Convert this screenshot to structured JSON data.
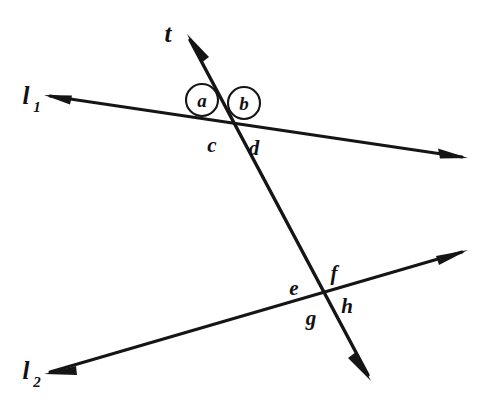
{
  "figure": {
    "background_color": "#ffffff",
    "ink_color": "#151515",
    "width": 485,
    "height": 413
  },
  "lines": [
    {
      "id": "l1",
      "label": "l",
      "subscript": "1",
      "label_x": 26,
      "label_y": 104,
      "sub_x": 41,
      "sub_y": 112,
      "x1": 50,
      "y1": 96,
      "x2": 462,
      "y2": 157,
      "arrow_start": true,
      "arrow_end": true,
      "stroke_width": 3.0
    },
    {
      "id": "l2",
      "label": "l",
      "subscript": "2",
      "label_x": 26,
      "label_y": 379,
      "sub_x": 41,
      "sub_y": 387,
      "x1": 50,
      "y1": 372,
      "x2": 462,
      "y2": 252,
      "arrow_start": true,
      "arrow_end": true,
      "stroke_width": 3.0
    },
    {
      "id": "t",
      "label": "t",
      "subscript": "",
      "label_x": 165,
      "label_y": 40,
      "sub_x": 0,
      "sub_y": 0,
      "x1": 190,
      "y1": 40,
      "x2": 368,
      "y2": 375,
      "arrow_start": true,
      "arrow_end": true,
      "stroke_width": 3.4
    }
  ],
  "intersections": [
    {
      "id": "upper",
      "x": 230,
      "y": 122,
      "lines": "l1 and t"
    },
    {
      "id": "lower",
      "x": 324,
      "y": 294,
      "lines": "l2 and t"
    }
  ],
  "circled_angle_labels": [
    {
      "id": "a",
      "text": "a",
      "cx": 202,
      "cy": 100,
      "r": 16
    },
    {
      "id": "b",
      "text": "b",
      "cx": 244,
      "cy": 103,
      "r": 16
    }
  ],
  "plain_angle_labels": [
    {
      "id": "c",
      "text": "c",
      "x": 212,
      "y": 152
    },
    {
      "id": "d",
      "text": "d",
      "x": 254,
      "y": 155
    },
    {
      "id": "e",
      "text": "e",
      "x": 294,
      "y": 295
    },
    {
      "id": "f",
      "text": "f",
      "x": 334,
      "y": 280
    },
    {
      "id": "g",
      "text": "g",
      "x": 311,
      "y": 325
    },
    {
      "id": "h",
      "text": "h",
      "x": 347,
      "y": 313
    }
  ]
}
